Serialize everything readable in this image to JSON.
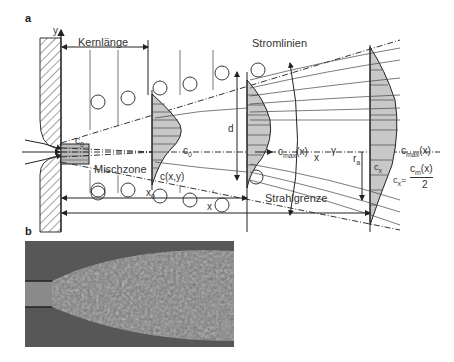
{
  "figure": {
    "panel_a": {
      "label": "a",
      "labels": {
        "y_axis": "y",
        "core_length": "Kernlänge",
        "streamlines": "Stromlinien",
        "c0_inlet": "c",
        "c0_inlet_sub": "0",
        "c0_profile": "c",
        "c0_profile_sub": "0",
        "d": "d",
        "cmax_mid": "c",
        "cmax_mid_sub": "max",
        "cmax_mid_arg": "(x)",
        "x_axis": "x",
        "gamma": "γ",
        "cxy_1": "c(x,y)",
        "cxy_2": "c(x,y)",
        "cmax_right": "c",
        "cmax_right_sub": "max",
        "cmax_right_arg": "(x)",
        "cx_1": "c",
        "cx_1_sub": "x",
        "cx_2": "c",
        "cx_2_sub": "x",
        "equals": "=",
        "frac_num": "c",
        "frac_num_sub": "m",
        "frac_num_arg": "(x)",
        "frac_den": "2",
        "ra": "r",
        "ra_sub": "a",
        "mixing_zone": "Mischzone",
        "x0": "x",
        "x0_sub": "0",
        "x_dim": "x",
        "jet_boundary": "Strahlgrenze"
      }
    },
    "panel_b": {
      "label": "b",
      "description": "photograph of turbulent free jet"
    }
  }
}
